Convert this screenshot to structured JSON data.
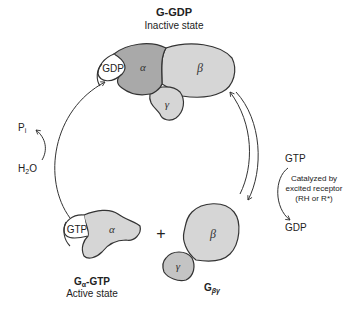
{
  "diagram": {
    "type": "G-protein activation cycle",
    "inactive": {
      "title": "G-GDP",
      "subtitle": "Inactive state",
      "nucleotide": "GDP",
      "subunits": [
        "α",
        "β",
        "γ"
      ]
    },
    "active_alpha": {
      "title_main": "G",
      "title_sub": "α",
      "title_rest": "-GTP",
      "subtitle": "Active state",
      "nucleotide": "GTP",
      "subunit": "α"
    },
    "beta_gamma": {
      "title_main": "G",
      "title_sub": "βγ",
      "subunits": [
        "β",
        "γ"
      ]
    },
    "plus": "+",
    "hydrolysis": {
      "product": "P",
      "product_sub": "i",
      "reactant_main": "H",
      "reactant_sub": "2",
      "reactant_rest": "O"
    },
    "exchange": {
      "in": "GTP",
      "out": "GDP",
      "catalyst_lines": [
        "Catalyzed by",
        "excited receptor",
        "(RH or R*)"
      ]
    },
    "colors": {
      "alpha_inactive": "#a9a9a9",
      "subunit_fill": "#d6d6d6",
      "outline": "#333333"
    }
  }
}
